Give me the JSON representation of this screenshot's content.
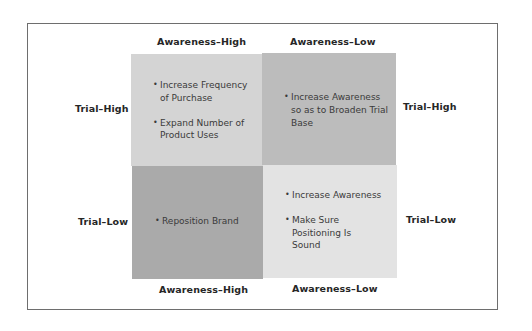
{
  "diagram": {
    "type": "2x2 matrix",
    "top_axis": [
      "Awareness–High",
      "Awareness–Low"
    ],
    "bottom_axis": [
      "Awareness–High",
      "Awareness–Low"
    ],
    "left_axis": [
      "Trial–High",
      "Trial–Low"
    ],
    "right_axis": [
      "Trial–High",
      "Trial–Low"
    ],
    "quadrants": {
      "top_left": {
        "fill": "#d4d4d4",
        "items": [
          "Increase Frequency of Purchase",
          "Expand Number of Product Uses"
        ]
      },
      "top_right": {
        "fill": "#bcbcbc",
        "items": [
          "Increase Awareness so as to Broaden Trial Base"
        ]
      },
      "bottom_left": {
        "fill": "#aaaaaa",
        "items": [
          "Reposition Brand"
        ]
      },
      "bottom_right": {
        "fill": "#e3e3e3",
        "items": [
          "Increase Awareness",
          "Make Sure Positioning Is Sound"
        ]
      }
    }
  }
}
